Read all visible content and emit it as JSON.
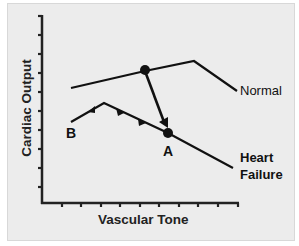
{
  "diagram": {
    "axes": {
      "y_label": "Cardiac Output",
      "x_label": "Vascular Tone"
    },
    "curves": [
      {
        "name": "Normal",
        "label": "Normal"
      },
      {
        "name": "Heart Failure",
        "label_line1": "Heart",
        "label_line2": "Failure"
      }
    ],
    "points": {
      "A": "A",
      "B": "B"
    },
    "colors": {
      "background": "#ececec",
      "line": "#111111"
    }
  }
}
